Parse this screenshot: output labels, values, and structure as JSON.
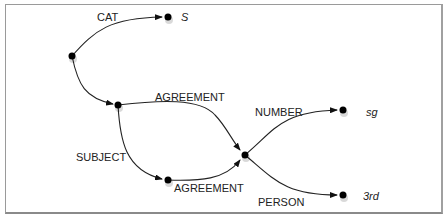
{
  "diagram": {
    "type": "feature-structure-graph",
    "nodes": [
      {
        "id": "root",
        "x": 72,
        "y": 56,
        "label": ""
      },
      {
        "id": "cat_val",
        "x": 168,
        "y": 17,
        "label": "S"
      },
      {
        "id": "agr_src",
        "x": 118,
        "y": 105,
        "label": ""
      },
      {
        "id": "subj_agr",
        "x": 168,
        "y": 180,
        "label": ""
      },
      {
        "id": "shared",
        "x": 245,
        "y": 155,
        "label": ""
      },
      {
        "id": "number_val",
        "x": 343,
        "y": 110,
        "label": "sg"
      },
      {
        "id": "person_val",
        "x": 343,
        "y": 195,
        "label": "3rd"
      }
    ],
    "edges": [
      {
        "from": "root",
        "to": "cat_val",
        "label": "CAT"
      },
      {
        "from": "root",
        "to": "agr_src",
        "label": ""
      },
      {
        "from": "agr_src",
        "to": "shared",
        "label": "AGREEMENT"
      },
      {
        "from": "agr_src",
        "to": "subj_agr",
        "label": "SUBJECT"
      },
      {
        "from": "subj_agr",
        "to": "shared",
        "label": "AGREEMENT"
      },
      {
        "from": "shared",
        "to": "number_val",
        "label": "NUMBER"
      },
      {
        "from": "shared",
        "to": "person_val",
        "label": "PERSON"
      }
    ],
    "labels": {
      "cat": "CAT",
      "s": "S",
      "agreement_top": "AGREEMENT",
      "subject": "SUBJECT",
      "agreement_bottom": "AGREEMENT",
      "number": "NUMBER",
      "sg": "sg",
      "person": "PERSON",
      "third": "3rd"
    }
  }
}
